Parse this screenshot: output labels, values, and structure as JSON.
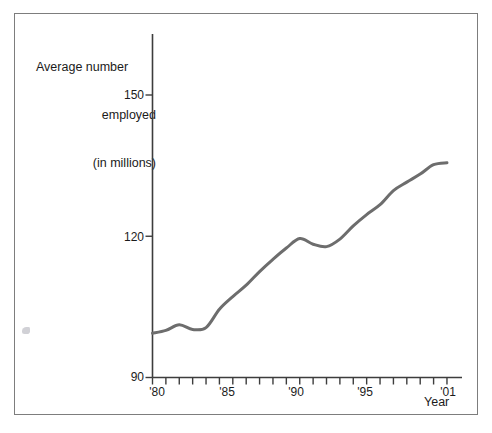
{
  "chart_data": {
    "type": "line",
    "title": "",
    "ylabel": "Average number employed (in millions)",
    "ylabel_lines": [
      "Average number",
      "employed",
      "(in millions)"
    ],
    "xlabel": "Year",
    "ylim": [
      90,
      155
    ],
    "xlim": [
      1979,
      2001.6
    ],
    "ytick_values": [
      90,
      120,
      150
    ],
    "ytick_labels": [
      "90",
      "120",
      "150"
    ],
    "xtick_values": [
      1979,
      1980,
      1981,
      1982,
      1983,
      1984,
      1985,
      1986,
      1987,
      1988,
      1989,
      1990,
      1991,
      1992,
      1993,
      1994,
      1995,
      1996,
      1997,
      1998,
      1999,
      2000,
      2001
    ],
    "xtick_labeled": [
      {
        "value": 1980,
        "label": "'80"
      },
      {
        "value": 1985,
        "label": "'85"
      },
      {
        "value": 1990,
        "label": "'90"
      },
      {
        "value": 1995,
        "label": "'95"
      },
      {
        "value": 2001,
        "label": "'01"
      }
    ],
    "grid": false,
    "legend": false,
    "line_color": "#6d6d6d",
    "line_width": 3,
    "series": [
      {
        "name": "Average number employed (in millions)",
        "x": [
          1979,
          1980,
          1981,
          1982,
          1983,
          1984,
          1985,
          1986,
          1987,
          1988,
          1989,
          1990,
          1991,
          1992,
          1993,
          1994,
          1995,
          1996,
          1997,
          1998,
          1999,
          2000,
          2001
        ],
        "values": [
          99.4,
          100.0,
          101.2,
          100.2,
          100.6,
          104.5,
          107.2,
          109.6,
          112.5,
          115.1,
          117.5,
          119.5,
          118.3,
          117.8,
          119.4,
          122.2,
          124.6,
          126.7,
          129.7,
          131.5,
          133.2,
          135.2,
          135.6
        ]
      }
    ]
  },
  "axes": {
    "y_axis_name": "y-axis",
    "x_axis_name": "x-axis"
  }
}
